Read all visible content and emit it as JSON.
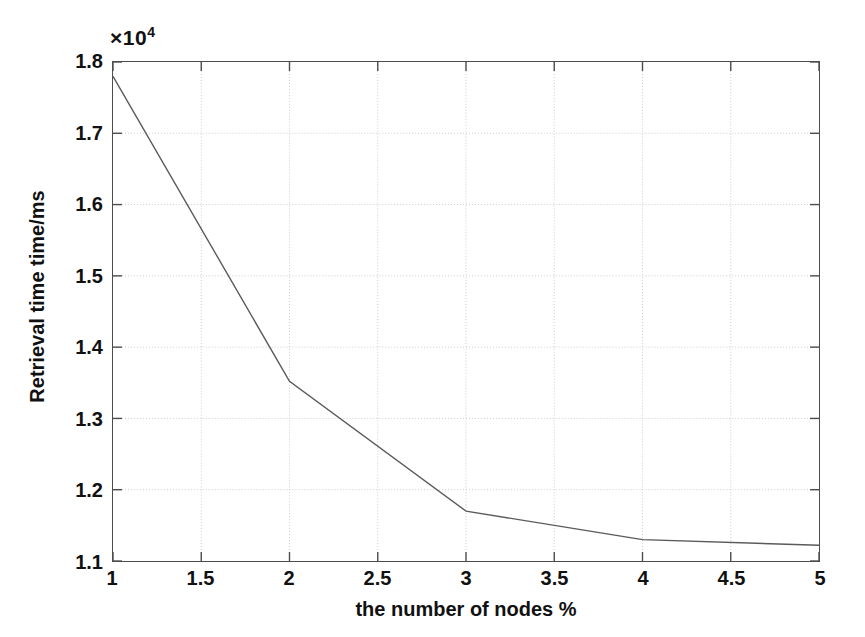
{
  "chart_data": {
    "type": "line",
    "title": "",
    "subtitle": "",
    "xlabel": "the number of nodes %",
    "ylabel": "Retrieval time time/ms",
    "y_multiplier_label": "×10",
    "y_multiplier_exponent": "4",
    "y_scale": 10000,
    "x": [
      1,
      2,
      3,
      4,
      5
    ],
    "values": [
      17800,
      13520,
      11700,
      11300,
      11220
    ],
    "values_scaled": [
      1.78,
      1.352,
      1.17,
      1.13,
      1.122
    ],
    "series": [
      {
        "name": "Retrieval time",
        "x": [
          1,
          2,
          3,
          4,
          5
        ],
        "values": [
          1.78,
          1.352,
          1.17,
          1.13,
          1.122
        ],
        "color": "#5a5a5a"
      }
    ],
    "xlim": [
      1,
      5
    ],
    "ylim": [
      1.1,
      1.8
    ],
    "xticks": [
      1,
      1.5,
      2,
      2.5,
      3,
      3.5,
      4,
      4.5,
      5
    ],
    "xtick_labels": [
      "1",
      "1.5",
      "2",
      "2.5",
      "3",
      "3.5",
      "4",
      "4.5",
      "5"
    ],
    "yticks": [
      1.1,
      1.2,
      1.3,
      1.4,
      1.5,
      1.6,
      1.7,
      1.8
    ],
    "ytick_labels": [
      "1.1",
      "1.2",
      "1.3",
      "1.4",
      "1.5",
      "1.6",
      "1.7",
      "1.8"
    ],
    "grid": true,
    "grid_style": "dotted",
    "grid_color": "#c8c8c8",
    "legend": false,
    "legend_position": "none",
    "annotations": [],
    "axis_color": "#4d4d4d",
    "background_color": "#ffffff",
    "line_color": "#5a5a5a",
    "line_width": 1.4,
    "markers": "none"
  }
}
